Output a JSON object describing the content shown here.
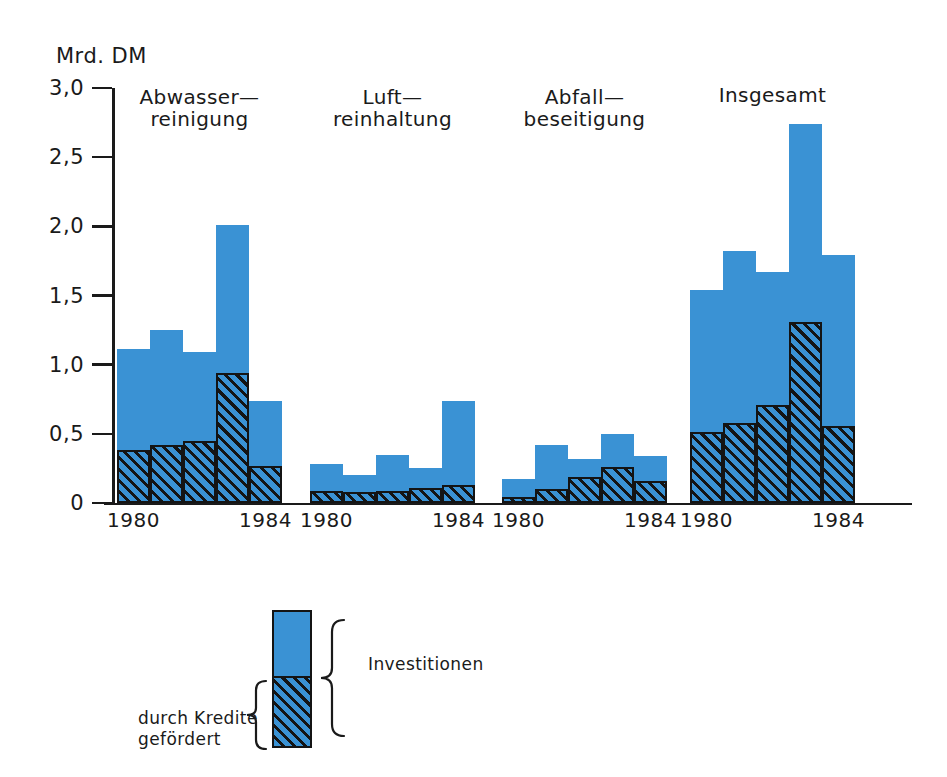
{
  "chart_data": {
    "type": "bar",
    "title": "",
    "subtitle": "",
    "ylabel": "Mrd. DM",
    "xlabel": "",
    "ylim": [
      0,
      3.0
    ],
    "ytick_labels": [
      "0",
      "0,5",
      "1,0",
      "1,5",
      "2,0",
      "2,5",
      "3,0"
    ],
    "ytick_values": [
      0,
      0.5,
      1.0,
      1.5,
      2.0,
      2.5,
      3.0
    ],
    "grid": false,
    "legend_position": "bottom-center",
    "stacked": true,
    "x": [
      1980,
      1981,
      1982,
      1983,
      1984
    ],
    "x_tick_labels": [
      "1980",
      "1984"
    ],
    "legend": [
      {
        "key": "investitionen",
        "label": "Investitionen",
        "color": "#3a92d4",
        "pattern": "solid"
      },
      {
        "key": "gefoerdert",
        "label": "durch Kredite\ngefördert",
        "color": "#3a92d4",
        "pattern": "diagonal-hatch"
      }
    ],
    "groups": [
      {
        "key": "abwasserreinigung",
        "label": "Abwasser—\nreinigung",
        "axis_labels": {
          "left": "1980",
          "right": "1984"
        },
        "series": [
          {
            "name": "Investitionen",
            "values": [
              1.11,
              1.25,
              1.09,
              2.01,
              0.74
            ]
          },
          {
            "name": "durch Kredite gefördert",
            "values": [
              0.38,
              0.42,
              0.45,
              0.94,
              0.27
            ]
          }
        ]
      },
      {
        "key": "luftreinhaltung",
        "label": "Luft—\nreinhaltung",
        "axis_labels": {
          "left": "1980",
          "right": "1984"
        },
        "series": [
          {
            "name": "Investitionen",
            "values": [
              0.28,
              0.2,
              0.35,
              0.25,
              0.74
            ]
          },
          {
            "name": "durch Kredite gefördert",
            "values": [
              0.09,
              0.08,
              0.09,
              0.11,
              0.13
            ]
          }
        ]
      },
      {
        "key": "abfallbeseitigung",
        "label": "Abfall—\nbeseitigung",
        "axis_labels": {
          "left": "1980",
          "right": "1984"
        },
        "series": [
          {
            "name": "Investitionen",
            "values": [
              0.17,
              0.42,
              0.32,
              0.5,
              0.34
            ]
          },
          {
            "name": "durch Kredite gefördert",
            "values": [
              0.04,
              0.1,
              0.19,
              0.26,
              0.16
            ]
          }
        ]
      },
      {
        "key": "insgesamt",
        "label": "Insgesamt",
        "axis_labels": {
          "left": "1980",
          "right": "1984"
        },
        "series": [
          {
            "name": "Investitionen",
            "values": [
              1.54,
              1.82,
              1.67,
              2.74,
              1.79
            ]
          },
          {
            "name": "durch Kredite gefördert",
            "values": [
              0.51,
              0.58,
              0.71,
              1.31,
              0.56
            ]
          }
        ]
      }
    ]
  },
  "colors": {
    "bar_blue": "#3a92d4",
    "ink": "#141414",
    "background": "#ffffff"
  }
}
